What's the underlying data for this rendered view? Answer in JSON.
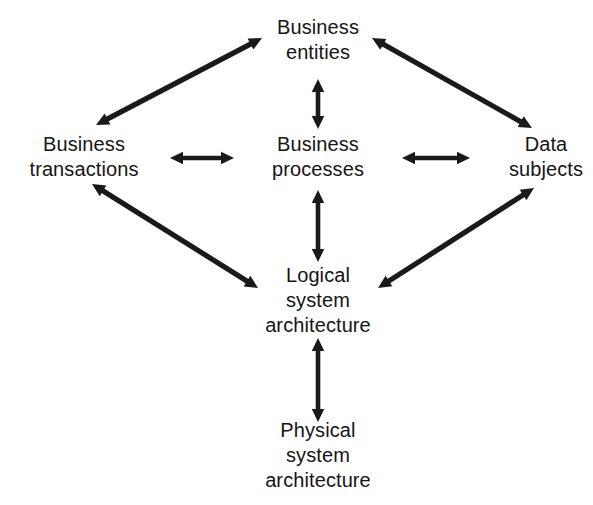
{
  "diagram": {
    "background_color": "#ffffff",
    "stroke_color": "#1a1a1a",
    "text_color": "#151515",
    "nodes": [
      {
        "id": "business-entities",
        "label": "Business entities",
        "lines": [
          "Business",
          "entities"
        ],
        "x": 318,
        "y": 40
      },
      {
        "id": "business-transactions",
        "label": "Business transactions",
        "lines": [
          "Business",
          "transactions"
        ],
        "x": 84,
        "y": 157
      },
      {
        "id": "business-processes",
        "label": "Business processes",
        "lines": [
          "Business",
          "processes"
        ],
        "x": 318,
        "y": 157
      },
      {
        "id": "data-subjects",
        "label": "Data subjects",
        "lines": [
          "Data",
          "subjects"
        ],
        "x": 546,
        "y": 157
      },
      {
        "id": "logical-system-architecture",
        "label": "Logical system architecture",
        "lines": [
          "Logical",
          "system",
          "architecture"
        ],
        "x": 318,
        "y": 300
      },
      {
        "id": "physical-system-architecture",
        "label": "Physical system architecture",
        "lines": [
          "Physical",
          "system",
          "architecture"
        ],
        "x": 318,
        "y": 455
      }
    ],
    "edges": [
      {
        "id": "transactions-entities",
        "from": "business-transactions",
        "to": "business-entities",
        "arrowheads": "both",
        "x1": 96,
        "y1": 125,
        "x2": 262,
        "y2": 38
      },
      {
        "id": "entities-data-subjects",
        "from": "business-entities",
        "to": "data-subjects",
        "arrowheads": "both",
        "x1": 372,
        "y1": 38,
        "x2": 532,
        "y2": 128
      },
      {
        "id": "entities-processes",
        "from": "business-entities",
        "to": "business-processes",
        "arrowheads": "both",
        "x1": 318,
        "y1": 79,
        "x2": 318,
        "y2": 129
      },
      {
        "id": "transactions-processes",
        "from": "business-transactions",
        "to": "business-processes",
        "arrowheads": "both",
        "x1": 170,
        "y1": 158,
        "x2": 234,
        "y2": 158
      },
      {
        "id": "processes-data-subjects",
        "from": "business-processes",
        "to": "data-subjects",
        "arrowheads": "both",
        "x1": 402,
        "y1": 158,
        "x2": 470,
        "y2": 158
      },
      {
        "id": "processes-logical-architecture",
        "from": "business-processes",
        "to": "logical-system-architecture",
        "arrowheads": "both",
        "x1": 318,
        "y1": 190,
        "x2": 318,
        "y2": 262
      },
      {
        "id": "transactions-logical-architecture",
        "from": "business-transactions",
        "to": "logical-system-architecture",
        "arrowheads": "both",
        "x1": 92,
        "y1": 184,
        "x2": 258,
        "y2": 288
      },
      {
        "id": "logical-architecture-data-subjects",
        "from": "logical-system-architecture",
        "to": "data-subjects",
        "arrowheads": "both",
        "x1": 378,
        "y1": 288,
        "x2": 534,
        "y2": 188
      },
      {
        "id": "logical-physical-architecture",
        "from": "logical-system-architecture",
        "to": "physical-system-architecture",
        "arrowheads": "both",
        "x1": 318,
        "y1": 338,
        "x2": 318,
        "y2": 422
      }
    ]
  }
}
